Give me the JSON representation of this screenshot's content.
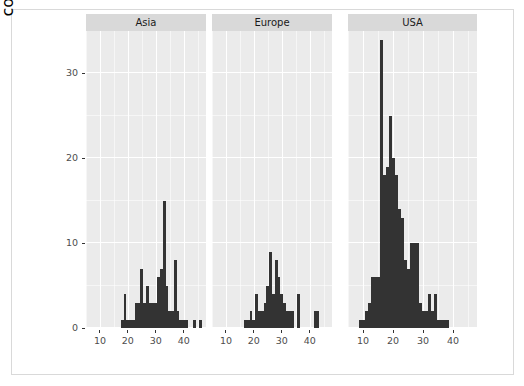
{
  "chart_data": {
    "type": "bar",
    "chart_style": "faceted-histogram",
    "title": "",
    "subtitle": "",
    "xlabel": "mpg",
    "ylabel": "count",
    "xlim": [
      5,
      48
    ],
    "ylim": [
      0,
      35
    ],
    "grid": true,
    "legend": null,
    "facet_variable": "country",
    "bin_width": 1,
    "x_ticks": [
      10,
      20,
      30,
      40
    ],
    "y_ticks": [
      0,
      10,
      20,
      30
    ],
    "bar_color": "#333333",
    "panel_background": "#ebebeb",
    "gridline_color": "#ffffff",
    "strip_background": "#d9d9d9",
    "panels": [
      {
        "label": "Asia",
        "x": [
          18,
          19,
          20,
          21,
          22,
          23,
          24,
          25,
          26,
          27,
          28,
          29,
          30,
          31,
          32,
          33,
          34,
          35,
          36,
          37,
          38,
          39,
          40,
          41,
          44,
          46
        ],
        "values": [
          1,
          4,
          1,
          1,
          1,
          3,
          3,
          7,
          3,
          5,
          3,
          3,
          3,
          6,
          7,
          15,
          5,
          2,
          2,
          8,
          2,
          1,
          1,
          1,
          1,
          1
        ]
      },
      {
        "label": "Europe",
        "x": [
          17,
          18,
          19,
          20,
          21,
          22,
          23,
          24,
          25,
          26,
          27,
          28,
          29,
          30,
          31,
          32,
          33,
          34,
          36,
          42,
          43
        ],
        "values": [
          1,
          1,
          2,
          1,
          4,
          2,
          2,
          3,
          5,
          9,
          4,
          8,
          6,
          4,
          3,
          2,
          2,
          2,
          4,
          2,
          2
        ]
      },
      {
        "label": "USA",
        "x": [
          9,
          10,
          11,
          12,
          13,
          14,
          15,
          16,
          17,
          18,
          19,
          20,
          21,
          22,
          23,
          24,
          25,
          26,
          27,
          28,
          29,
          30,
          31,
          32,
          33,
          34,
          35,
          36,
          37,
          38
        ],
        "values": [
          1,
          1,
          2,
          3,
          6,
          6,
          6,
          34,
          18,
          19,
          25,
          20,
          18,
          14,
          13,
          8,
          7,
          10,
          10,
          10,
          3,
          2,
          2,
          4,
          2,
          4,
          1,
          1,
          1,
          1
        ]
      }
    ]
  },
  "axes": {
    "y_title": "count",
    "x_title": "mpg",
    "y_tick_labels": [
      "0",
      "10",
      "20",
      "30"
    ],
    "x_tick_labels": [
      "10",
      "20",
      "30",
      "40"
    ]
  }
}
